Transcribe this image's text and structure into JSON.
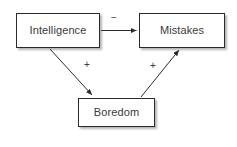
{
  "diagram": {
    "type": "causal-loop-diagram",
    "background_color": "#ffffff",
    "stroke_color": "#2b2b2b",
    "text_color": "#3a3a3a",
    "nodes": [
      {
        "id": "intelligence",
        "label": "Intelligence"
      },
      {
        "id": "mistakes",
        "label": "Mistakes"
      },
      {
        "id": "boredom",
        "label": "Boredom"
      }
    ],
    "edges": [
      {
        "id": "intelligence-to-mistakes",
        "from": "Intelligence",
        "to": "Mistakes",
        "label": "−",
        "polarity": "negative"
      },
      {
        "id": "intelligence-to-boredom",
        "from": "Intelligence",
        "to": "Boredom",
        "label": "+",
        "polarity": "positive"
      },
      {
        "id": "boredom-to-mistakes",
        "from": "Boredom",
        "to": "Mistakes",
        "label": "+",
        "polarity": "positive"
      }
    ]
  }
}
